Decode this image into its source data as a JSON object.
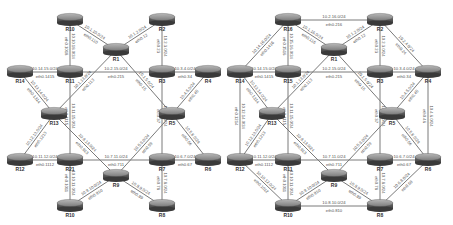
{
  "panels": [
    {
      "id": "left",
      "routers": [
        {
          "name": "R10",
          "x": 70,
          "y": 20
        },
        {
          "name": "R2",
          "x": 162,
          "y": 20
        },
        {
          "name": "R1",
          "x": 116,
          "y": 50
        },
        {
          "name": "R14",
          "x": 20,
          "y": 72
        },
        {
          "name": "R11",
          "x": 70,
          "y": 72
        },
        {
          "name": "R3",
          "x": 162,
          "y": 72
        },
        {
          "name": "R4",
          "x": 208,
          "y": 72
        },
        {
          "name": "R13",
          "x": 54,
          "y": 114
        },
        {
          "name": "R5",
          "x": 172,
          "y": 114
        },
        {
          "name": "R12",
          "x": 20,
          "y": 160
        },
        {
          "name": "R21",
          "x": 70,
          "y": 160
        },
        {
          "name": "R7",
          "x": 162,
          "y": 160
        },
        {
          "name": "R6",
          "x": 208,
          "y": 160
        },
        {
          "name": "R9",
          "x": 116,
          "y": 176
        },
        {
          "name": "R10",
          "x": 70,
          "y": 206
        },
        {
          "name": "R8",
          "x": 162,
          "y": 206
        }
      ],
      "links": [
        {
          "a": [
            70,
            20
          ],
          "b": [
            116,
            50
          ],
          "net": "10.1.10.0/24",
          "iface": "eth0.110"
        },
        {
          "a": [
            162,
            20
          ],
          "b": [
            116,
            50
          ],
          "net": "10.1.2.0/24",
          "iface": "eth0.12"
        },
        {
          "a": [
            70,
            20
          ],
          "b": [
            70,
            72
          ],
          "net": "10.10.18.0/24",
          "iface": "eth0.1018"
        },
        {
          "a": [
            162,
            20
          ],
          "b": [
            162,
            72
          ],
          "net": "10.2.3.0/24",
          "iface": "eth0.23"
        },
        {
          "a": [
            20,
            72
          ],
          "b": [
            70,
            72
          ],
          "net": "10.14.15.0/24",
          "iface": "eth0.1415"
        },
        {
          "a": [
            70,
            72
          ],
          "b": [
            162,
            72
          ],
          "net": "10.2.15.0/24",
          "iface": "eth0.215"
        },
        {
          "a": [
            162,
            72
          ],
          "b": [
            208,
            72
          ],
          "net": "10.3.4.0/24",
          "iface": "eth0.34"
        },
        {
          "a": [
            116,
            50
          ],
          "b": [
            54,
            114
          ],
          "net": "10.1.13.0/24",
          "iface": "eth0.113"
        },
        {
          "a": [
            116,
            50
          ],
          "b": [
            172,
            114
          ],
          "net": "10.1.5.0/24",
          "iface": "eth0.15"
        },
        {
          "a": [
            20,
            72
          ],
          "b": [
            54,
            114
          ],
          "net": "10.13.14.0/24",
          "iface": "eth0.1314"
        },
        {
          "a": [
            208,
            72
          ],
          "b": [
            172,
            114
          ],
          "net": "10.4.5.0/24",
          "iface": "eth0.45"
        },
        {
          "a": [
            70,
            72
          ],
          "b": [
            70,
            160
          ],
          "net": "10.11.15.0/24",
          "iface": "eth0.1115"
        },
        {
          "a": [
            162,
            72
          ],
          "b": [
            162,
            160
          ],
          "net": "10.3.7.0/24",
          "iface": "eth0.37"
        },
        {
          "a": [
            54,
            114
          ],
          "b": [
            20,
            160
          ],
          "net": "10.12.13.0/24",
          "iface": "eth0.1213"
        },
        {
          "a": [
            172,
            114
          ],
          "b": [
            208,
            160
          ],
          "net": "10.5.6.0/24",
          "iface": "eth0.56"
        },
        {
          "a": [
            54,
            114
          ],
          "b": [
            116,
            176
          ],
          "net": "10.9.13.0/24",
          "iface": "eth0.913"
        },
        {
          "a": [
            172,
            114
          ],
          "b": [
            116,
            176
          ],
          "net": "10.5.9.0/24",
          "iface": "eth0.59"
        },
        {
          "a": [
            20,
            160
          ],
          "b": [
            70,
            160
          ],
          "net": "10.11.12.0/24",
          "iface": "eth0.1112"
        },
        {
          "a": [
            70,
            160
          ],
          "b": [
            162,
            160
          ],
          "net": "10.7.11.0/24",
          "iface": "eth0.711"
        },
        {
          "a": [
            162,
            160
          ],
          "b": [
            208,
            160
          ],
          "net": "10.6.7.0/24",
          "iface": "eth0.67"
        },
        {
          "a": [
            70,
            160
          ],
          "b": [
            70,
            206
          ],
          "net": "10.10.11.0/24",
          "iface": "eth0.1011"
        },
        {
          "a": [
            162,
            160
          ],
          "b": [
            162,
            206
          ],
          "net": "10.7.8.0/24",
          "iface": "eth0.78"
        },
        {
          "a": [
            116,
            176
          ],
          "b": [
            70,
            206
          ],
          "net": "10.9.10.0/24",
          "iface": "eth0.910"
        },
        {
          "a": [
            116,
            176
          ],
          "b": [
            162,
            206
          ],
          "net": "10.8.9.0/24",
          "iface": "eth0.89"
        }
      ]
    },
    {
      "id": "right",
      "routers": [
        {
          "name": "R16",
          "x": 288,
          "y": 20
        },
        {
          "name": "R2",
          "x": 380,
          "y": 20
        },
        {
          "name": "R1",
          "x": 334,
          "y": 50
        },
        {
          "name": "R14",
          "x": 240,
          "y": 72
        },
        {
          "name": "R15",
          "x": 288,
          "y": 72
        },
        {
          "name": "R3",
          "x": 380,
          "y": 72
        },
        {
          "name": "R4",
          "x": 428,
          "y": 72
        },
        {
          "name": "R13",
          "x": 272,
          "y": 114
        },
        {
          "name": "R5",
          "x": 392,
          "y": 114
        },
        {
          "name": "R12",
          "x": 240,
          "y": 160
        },
        {
          "name": "R11",
          "x": 288,
          "y": 160
        },
        {
          "name": "R7",
          "x": 380,
          "y": 160
        },
        {
          "name": "R6",
          "x": 428,
          "y": 160
        },
        {
          "name": "R9",
          "x": 334,
          "y": 176
        },
        {
          "name": "R10",
          "x": 288,
          "y": 206
        },
        {
          "name": "R8",
          "x": 380,
          "y": 206
        }
      ],
      "links": [
        {
          "a": [
            288,
            20
          ],
          "b": [
            380,
            20
          ],
          "net": "10.2.16.0/24",
          "iface": "eth0.216"
        },
        {
          "a": [
            288,
            20
          ],
          "b": [
            334,
            50
          ],
          "net": "10.1.16.0/24",
          "iface": "eth0.116"
        },
        {
          "a": [
            380,
            20
          ],
          "b": [
            334,
            50
          ],
          "net": "10.1.2.0/24",
          "iface": "eth0.12"
        },
        {
          "a": [
            288,
            20
          ],
          "b": [
            240,
            72
          ],
          "net": "10.14.16.0/24",
          "iface": "eth0.1416"
        },
        {
          "a": [
            380,
            20
          ],
          "b": [
            428,
            72
          ],
          "net": "10.2.4.0/24",
          "iface": "eth0.24"
        },
        {
          "a": [
            288,
            20
          ],
          "b": [
            288,
            72
          ],
          "net": "10.15.16.0/24",
          "iface": "eth0.1516"
        },
        {
          "a": [
            380,
            20
          ],
          "b": [
            380,
            72
          ],
          "net": "10.2.3.0/24",
          "iface": "eth0.23"
        },
        {
          "a": [
            240,
            72
          ],
          "b": [
            288,
            72
          ],
          "net": "10.14.15.0/24",
          "iface": "eth0.1415"
        },
        {
          "a": [
            288,
            72
          ],
          "b": [
            380,
            72
          ],
          "net": "10.2.15.0/24",
          "iface": "eth0.215"
        },
        {
          "a": [
            380,
            72
          ],
          "b": [
            428,
            72
          ],
          "net": "10.3.4.0/24",
          "iface": "eth0.34"
        },
        {
          "a": [
            334,
            50
          ],
          "b": [
            272,
            114
          ],
          "net": "10.1.13.0/24",
          "iface": "eth0.113"
        },
        {
          "a": [
            334,
            50
          ],
          "b": [
            392,
            114
          ],
          "net": "10.1.5.0/24",
          "iface": "eth0.15"
        },
        {
          "a": [
            240,
            72
          ],
          "b": [
            272,
            114
          ],
          "net": "10.13.14.0/24",
          "iface": "eth0.1314"
        },
        {
          "a": [
            428,
            72
          ],
          "b": [
            392,
            114
          ],
          "net": "10.4.5.0/24",
          "iface": "eth0.45"
        },
        {
          "a": [
            240,
            72
          ],
          "b": [
            240,
            160
          ],
          "net": "10.12.14.0/24",
          "iface": "eth0.1214"
        },
        {
          "a": [
            428,
            72
          ],
          "b": [
            428,
            160
          ],
          "net": "10.4.6.0/24",
          "iface": "eth0.46"
        },
        {
          "a": [
            288,
            72
          ],
          "b": [
            288,
            160
          ],
          "net": "10.11.15.0/24",
          "iface": "eth0.1115"
        },
        {
          "a": [
            380,
            72
          ],
          "b": [
            380,
            160
          ],
          "net": "10.3.7.0/24",
          "iface": "eth0.37"
        },
        {
          "a": [
            272,
            114
          ],
          "b": [
            240,
            160
          ],
          "net": "10.12.13.0/24",
          "iface": "eth0.1213"
        },
        {
          "a": [
            392,
            114
          ],
          "b": [
            428,
            160
          ],
          "net": "10.5.6.0/24",
          "iface": "eth0.56"
        },
        {
          "a": [
            272,
            114
          ],
          "b": [
            334,
            176
          ],
          "net": "10.9.13.0/24",
          "iface": "eth0.913"
        },
        {
          "a": [
            392,
            114
          ],
          "b": [
            334,
            176
          ],
          "net": "10.5.9.0/24",
          "iface": "eth0.59"
        },
        {
          "a": [
            240,
            160
          ],
          "b": [
            288,
            160
          ],
          "net": "10.11.12.0/24",
          "iface": "eth0.1112"
        },
        {
          "a": [
            288,
            160
          ],
          "b": [
            380,
            160
          ],
          "net": "10.7.11.0/24",
          "iface": "eth0.711"
        },
        {
          "a": [
            380,
            160
          ],
          "b": [
            428,
            160
          ],
          "net": "10.6.7.0/24",
          "iface": "eth0.67"
        },
        {
          "a": [
            240,
            160
          ],
          "b": [
            288,
            206
          ],
          "net": "10.10.12.0/24",
          "iface": "eth0.1012"
        },
        {
          "a": [
            428,
            160
          ],
          "b": [
            380,
            206
          ],
          "net": "10.6.8.0/24",
          "iface": "eth0.68"
        },
        {
          "a": [
            288,
            160
          ],
          "b": [
            288,
            206
          ],
          "net": "10.10.11.0/24",
          "iface": "eth0.1011"
        },
        {
          "a": [
            380,
            160
          ],
          "b": [
            380,
            206
          ],
          "net": "10.7.8.0/24",
          "iface": "eth0.78"
        },
        {
          "a": [
            334,
            176
          ],
          "b": [
            288,
            206
          ],
          "net": "10.9.10.0/24",
          "iface": "eth0.910"
        },
        {
          "a": [
            334,
            176
          ],
          "b": [
            380,
            206
          ],
          "net": "10.8.9.0/24",
          "iface": "eth0.89"
        },
        {
          "a": [
            288,
            206
          ],
          "b": [
            380,
            206
          ],
          "net": "10.8.10.0/24",
          "iface": "eth0.810"
        }
      ]
    }
  ],
  "colors": {
    "link": "#7a7a7a",
    "router_top": "#9a9a9a",
    "router_body": "#5a5a5a",
    "label": "#555555",
    "router_name": "#333333"
  }
}
